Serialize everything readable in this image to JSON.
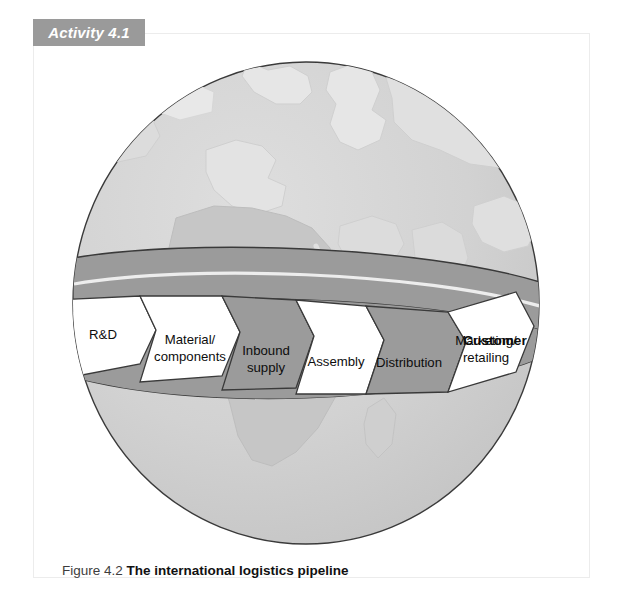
{
  "banner": {
    "label": "Activity 4.1"
  },
  "caption": {
    "number": "Figure 4.2",
    "title": "The international logistics pipeline"
  },
  "figure": {
    "kind": "globe-with-logistics-pipeline",
    "globe": {
      "name": "world-globe",
      "ocean_color": "#cbcbcb",
      "land_color": "#e4e4e4",
      "outline_color": "#3a3a3a"
    },
    "pipeline": {
      "band_top_color": "#9b9b9b",
      "band_highlight_color": "#ededed",
      "segment_fill_white": "#ffffff",
      "segment_fill_gray": "#9b9b9b",
      "outline_color": "#3a3a3a",
      "stages": [
        {
          "id": "rnd",
          "label_lines": [
            "R&D"
          ],
          "fill": "white"
        },
        {
          "id": "material-components",
          "label_lines": [
            "Material/",
            "components"
          ],
          "fill": "white"
        },
        {
          "id": "inbound-supply",
          "label_lines": [
            "Inbound",
            "supply"
          ],
          "fill": "gray"
        },
        {
          "id": "assembly",
          "label_lines": [
            "Assembly"
          ],
          "fill": "white"
        },
        {
          "id": "distribution",
          "label_lines": [
            "Distribution"
          ],
          "fill": "gray"
        },
        {
          "id": "marketing-retailing",
          "label_lines": [
            "Marketing/",
            "retailing"
          ],
          "fill": "white"
        }
      ],
      "endpoint": {
        "id": "customer",
        "label": "Customer"
      }
    }
  }
}
